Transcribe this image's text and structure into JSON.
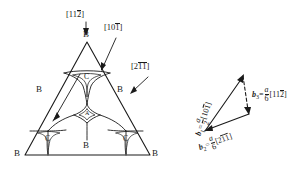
{
  "figure": {
    "type": "crystallography-diagram",
    "left_panel": {
      "name": "dislocation-node-triangle",
      "outer_triangle_edge_labels": [
        {
          "id": "edge-top-right",
          "text": "[10",
          "bar": "1",
          "tail": "]"
        },
        {
          "id": "edge-right",
          "text": "[2",
          "bar1": "1",
          "bar2": "1",
          "tail": "]"
        },
        {
          "id": "apex-direction",
          "text": "[11",
          "bar": "2",
          "tail": "]"
        }
      ],
      "miller_labels": [
        {
          "name": "label-112",
          "prefix": "[11",
          "overbar": "2",
          "suffix": "]"
        },
        {
          "name": "label-101",
          "prefix": "[10",
          "overbar": "1",
          "suffix": "]"
        },
        {
          "name": "label-211",
          "prefix": "[2",
          "overbar_a": "1",
          "overbar_b": "1",
          "suffix": "]"
        }
      ],
      "site_labels": [
        {
          "name": "site-apex-top",
          "text": "B"
        },
        {
          "name": "site-left-mid",
          "text": "B"
        },
        {
          "name": "site-right-mid",
          "text": "B"
        },
        {
          "name": "site-bottom-left",
          "text": "B"
        },
        {
          "name": "site-bottom-mid",
          "text": "B"
        },
        {
          "name": "site-bottom-right",
          "text": "B"
        },
        {
          "name": "fault-upper",
          "text": "C"
        },
        {
          "name": "fault-lower-left",
          "text": "C"
        },
        {
          "name": "fault-lower-right",
          "text": "C"
        },
        {
          "name": "fault-center",
          "text": "A"
        }
      ]
    },
    "right_panel": {
      "name": "burgers-vector-triangle",
      "vectors": [
        {
          "name": "vector-b1",
          "symbol": "b",
          "subscript": "1",
          "equals": "=",
          "numerator": "a",
          "denominator": "2",
          "bracket_open": "[",
          "indices": "10",
          "overbar": "1",
          "bracket_close": "]"
        },
        {
          "name": "vector-b3",
          "symbol": "b",
          "subscript": "3",
          "equals": "=",
          "numerator": "a",
          "denominator": "6",
          "bracket_open": "[",
          "indices": "11",
          "overbar": "2",
          "bracket_close": "]"
        },
        {
          "name": "vector-b2",
          "symbol": "b",
          "subscript": "2",
          "equals": "=",
          "numerator": "a",
          "denominator": "6",
          "bracket_open": "[",
          "indices": "2",
          "overbar_a": "1",
          "overbar_b": "1",
          "bracket_close": "]"
        }
      ]
    },
    "colors": {
      "line": "#1a1a1a",
      "background": "#ffffff",
      "fault_fill": "#ffffff"
    }
  }
}
